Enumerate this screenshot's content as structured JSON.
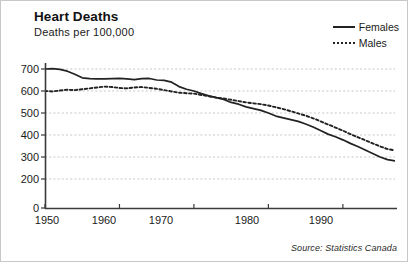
{
  "title": "Heart Deaths",
  "subtitle": "Deaths per 100,000",
  "source": "Source: Statistics Canada",
  "legend": {
    "items": [
      {
        "label": "Females",
        "style": "solid",
        "color": "#222222"
      },
      {
        "label": "Males",
        "style": "dotted",
        "color": "#222222"
      }
    ]
  },
  "chart_data": {
    "type": "line",
    "title": "Heart Deaths",
    "subtitle": "Deaths per 100,000",
    "xlabel": "",
    "ylabel": "Deaths per 100,000",
    "xlim": [
      1950,
      1997
    ],
    "ylim": [
      0,
      700
    ],
    "grid": true,
    "legend_position": "top-right",
    "ytick_labels": [
      "700",
      "600",
      "500",
      "400",
      "300",
      "200",
      "0"
    ],
    "ytick_values": [
      700,
      600,
      500,
      400,
      300,
      200,
      0
    ],
    "xtick_labels": [
      "1950",
      "1960",
      "1970",
      "1980",
      "1990"
    ],
    "xtick_values": [
      1950,
      1960,
      1970,
      1980,
      1990
    ],
    "note": "y-axis label for 100 is omitted; the 200-to-0 segment is compressed",
    "x": [
      1950,
      1951,
      1952,
      1953,
      1954,
      1955,
      1956,
      1957,
      1958,
      1959,
      1960,
      1961,
      1962,
      1963,
      1964,
      1965,
      1966,
      1967,
      1968,
      1969,
      1970,
      1971,
      1972,
      1973,
      1974,
      1975,
      1976,
      1977,
      1978,
      1979,
      1980,
      1981,
      1982,
      1983,
      1984,
      1985,
      1986,
      1987,
      1988,
      1989,
      1990,
      1991,
      1992,
      1993,
      1994,
      1995,
      1996,
      1997
    ],
    "series": [
      {
        "name": "Females",
        "style": "solid",
        "color": "#222222",
        "values": [
          700,
          702,
          698,
          690,
          676,
          660,
          656,
          655,
          655,
          656,
          657,
          655,
          652,
          656,
          657,
          650,
          648,
          640,
          620,
          608,
          600,
          588,
          578,
          570,
          562,
          548,
          540,
          528,
          520,
          512,
          500,
          486,
          478,
          470,
          462,
          450,
          436,
          420,
          404,
          392,
          378,
          362,
          348,
          332,
          316,
          300,
          288,
          282
        ]
      },
      {
        "name": "Males",
        "style": "dotted",
        "color": "#222222",
        "values": [
          600,
          598,
          602,
          606,
          604,
          608,
          612,
          616,
          620,
          618,
          614,
          612,
          616,
          618,
          614,
          610,
          604,
          598,
          592,
          590,
          588,
          582,
          576,
          570,
          566,
          560,
          554,
          548,
          544,
          540,
          534,
          526,
          518,
          508,
          498,
          488,
          476,
          462,
          448,
          434,
          420,
          404,
          390,
          376,
          362,
          348,
          336,
          330
        ]
      }
    ],
    "observations": {
      "crossover_year": 1967,
      "females_start": 700,
      "females_end": 225,
      "males_start": 600,
      "males_peak": 620,
      "males_end": 250
    }
  },
  "yticks": [
    {
      "label": "700",
      "top": 68
    },
    {
      "label": "600",
      "top": 90
    },
    {
      "label": "500",
      "top": 112
    },
    {
      "label": "400",
      "top": 134
    },
    {
      "label": "300",
      "top": 156
    },
    {
      "label": "200",
      "top": 178
    },
    {
      "label": "0",
      "top": 207
    }
  ],
  "xticks": [
    {
      "label": "1950",
      "left": 46
    },
    {
      "label": "1960",
      "left": 103
    },
    {
      "label": "1970",
      "left": 160
    },
    {
      "label": "1980",
      "left": 246
    },
    {
      "label": "1990",
      "left": 320
    }
  ]
}
